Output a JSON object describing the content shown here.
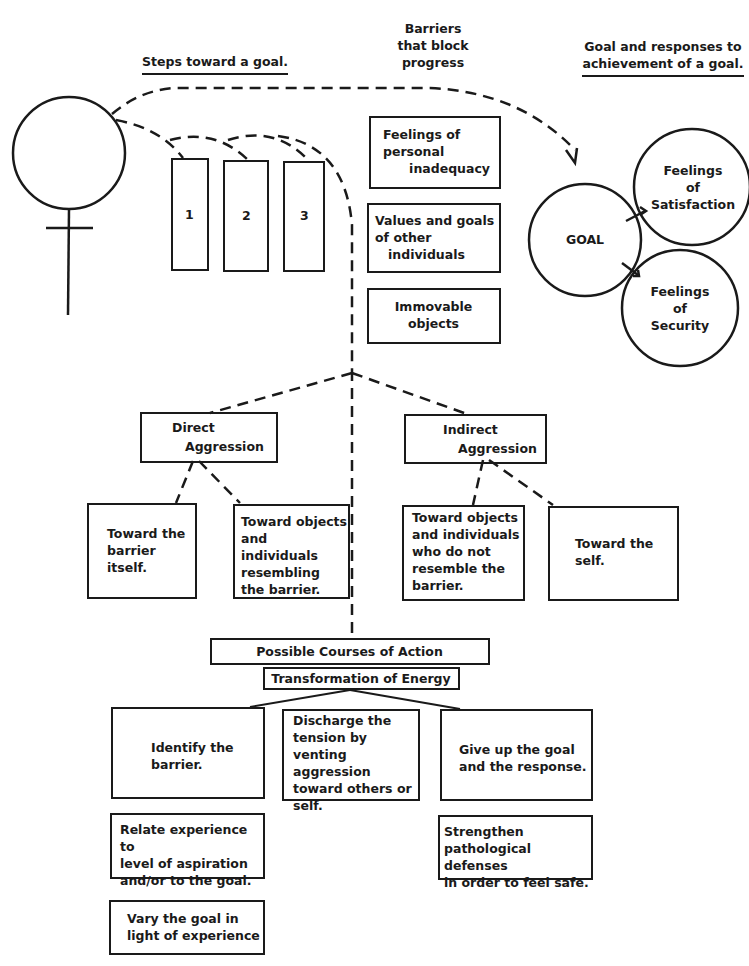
{
  "headings": {
    "steps": "Steps toward a goal.",
    "barriers": "Barriers\nthat block\nprogress",
    "goal_responses_line1": "Goal and responses to",
    "goal_responses_line2": "achievement of a goal."
  },
  "person": {
    "symbol": "person-figure-icon"
  },
  "steps": [
    {
      "label": "1"
    },
    {
      "label": "2"
    },
    {
      "label": "3"
    }
  ],
  "barriers": [
    {
      "label": "Feelings of\npersonal\n      inadequacy"
    },
    {
      "label": "Values and goals\nof other\n   individuals"
    },
    {
      "label": "Immovable\nobjects"
    }
  ],
  "goal": {
    "label": "GOAL",
    "responses": [
      {
        "label": "Feelings\nof\nSatisfaction"
      },
      {
        "label": "Feelings\nof\nSecurity"
      }
    ]
  },
  "aggression": {
    "direct": {
      "label_line1": "Direct",
      "label_line2": "Aggression",
      "targets": [
        {
          "label": "Toward the\nbarrier\nitself."
        },
        {
          "label": "Toward objects\nand individuals\nresembling\nthe barrier."
        }
      ]
    },
    "indirect": {
      "label_line1": "Indirect",
      "label_line2": "Aggression",
      "targets": [
        {
          "label": "Toward objects\nand individuals\nwho do not\nresemble the\nbarrier."
        },
        {
          "label": "Toward the\nself."
        }
      ]
    }
  },
  "actions": {
    "title": "Possible Courses of Action",
    "subtitle": "Transformation of Energy",
    "options": [
      {
        "label": "Identify the\nbarrier."
      },
      {
        "label": "Discharge the\ntension by\nventing aggression\ntoward others or\nself."
      },
      {
        "label": "Give up the goal\nand the response."
      }
    ],
    "followups_left": [
      {
        "label": "Relate experience to\nlevel of aspiration\nand/or to the goal."
      },
      {
        "label": "Vary the goal in\nlight of experience"
      }
    ],
    "followups_right": [
      {
        "label": "Strengthen\npathological defenses\nin order to feel safe."
      }
    ]
  }
}
